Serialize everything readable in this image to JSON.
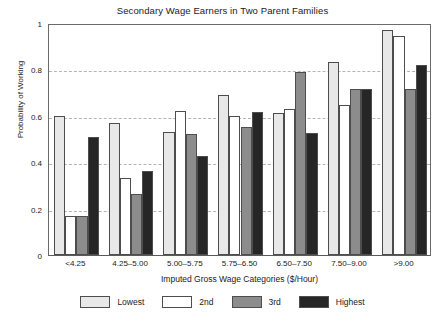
{
  "chart_data": {
    "type": "bar",
    "title": "Secondary Wage Earners in Two Parent Families",
    "xlabel": "Imputed Gross Wage Categories ($/Hour)",
    "ylabel": "Probability of Working",
    "categories": [
      "<4.25",
      "4.25–5.00",
      "5.00–5.75",
      "5.75–6.50",
      "6.50–7.50",
      "7.50–9.00",
      ">9.00"
    ],
    "series": [
      {
        "name": "Lowest",
        "color": "#e8e8e8",
        "values": [
          0.6,
          0.57,
          0.53,
          0.69,
          0.61,
          0.83,
          0.97
        ]
      },
      {
        "name": "2nd",
        "color": "#ffffff",
        "values": [
          0.17,
          0.33,
          0.62,
          0.6,
          0.63,
          0.645,
          0.945
        ]
      },
      {
        "name": "3rd",
        "color": "#8c8c8c",
        "values": [
          0.17,
          0.265,
          0.52,
          0.55,
          0.79,
          0.715,
          0.715
        ]
      },
      {
        "name": "Highest",
        "color": "#262626",
        "values": [
          0.51,
          0.36,
          0.425,
          0.615,
          0.525,
          0.715,
          0.82
        ]
      }
    ],
    "ylim": [
      0,
      1
    ],
    "yticks": [
      0,
      0.2,
      0.4,
      0.6,
      0.8,
      1
    ],
    "ytick_labels": [
      "0",
      "0.2",
      "0.4",
      "0.6",
      "0.8",
      "1"
    ],
    "gridlines": [
      0.2,
      0.4,
      0.6,
      0.8
    ],
    "grid": true,
    "legend_position": "bottom"
  },
  "legend": {
    "items": [
      {
        "label": "Lowest",
        "color": "#e8e8e8"
      },
      {
        "label": "2nd",
        "color": "#ffffff"
      },
      {
        "label": "3rd",
        "color": "#8c8c8c"
      },
      {
        "label": "Highest",
        "color": "#262626"
      }
    ]
  }
}
